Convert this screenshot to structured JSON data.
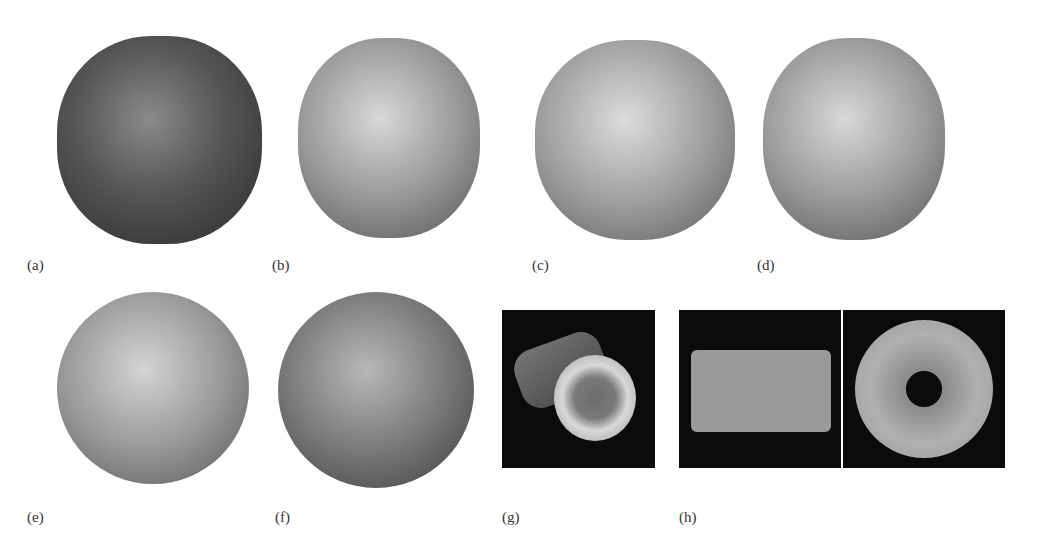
{
  "figure": {
    "panels": [
      {
        "id": "a",
        "label": "(a)",
        "type": "icosahedral-capsid",
        "shading": "dark-mottled"
      },
      {
        "id": "b",
        "label": "(b)",
        "type": "icosahedral-capsid",
        "shading": "light-mottled"
      },
      {
        "id": "c",
        "label": "(c)",
        "type": "icosahedral-capsid",
        "shading": "light-porous"
      },
      {
        "id": "d",
        "label": "(d)",
        "type": "icosahedral-capsid",
        "shading": "light-mottled"
      },
      {
        "id": "e",
        "label": "(e)",
        "type": "spherical-capsid",
        "shading": "light-mottled"
      },
      {
        "id": "f",
        "label": "(f)",
        "type": "spherical-capsid",
        "shading": "dark-mottled"
      },
      {
        "id": "g",
        "label": "(g)",
        "type": "helical-tube-oblique",
        "background": "black"
      },
      {
        "id": "h",
        "label": "(h)",
        "type": "disk-side-and-top-views",
        "background": "black"
      }
    ]
  }
}
